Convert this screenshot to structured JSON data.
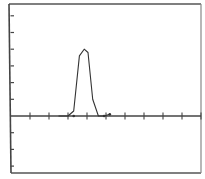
{
  "chart_data": {
    "type": "line",
    "title": "",
    "xlabel": "",
    "ylabel": "",
    "grid": false,
    "legend": null,
    "x_ticks": [
      1,
      2,
      3,
      4,
      5,
      6,
      7,
      8,
      9,
      10
    ],
    "y_ticks_above": [
      1,
      2,
      3,
      4,
      5,
      6
    ],
    "y_ticks_below": [
      -1,
      -2,
      -3
    ],
    "xlim": [
      0,
      10
    ],
    "ylim": [
      -3.4,
      6.8
    ],
    "series": [
      {
        "name": "pulse",
        "x": [
          2.5,
          3.0,
          3.3,
          3.6,
          3.85,
          4.05,
          4.3,
          4.6,
          4.9,
          5.2
        ],
        "y": [
          0,
          0,
          0.3,
          3.6,
          4.0,
          3.8,
          1.0,
          0,
          0,
          0.1
        ]
      }
    ],
    "markers": [
      {
        "x": 3.3,
        "y": 0
      },
      {
        "x": 4.9,
        "y": 0
      },
      {
        "x": 5.2,
        "y": 0.1
      }
    ]
  },
  "colors": {
    "frame": "#555555",
    "axis": "#444444",
    "line": "#333333",
    "background": "#ffffff"
  }
}
